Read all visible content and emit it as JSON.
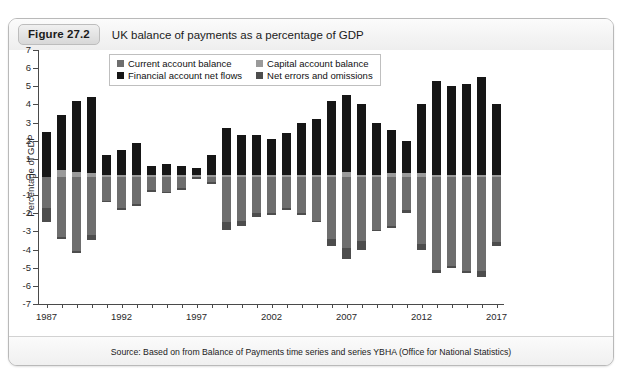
{
  "figure": {
    "badge": "Figure 27.2",
    "title": "UK balance of payments as a percentage of GDP",
    "source_prefix": "Source:",
    "source_text": "Source: Based on from Balance of Payments time series and series YBHA (Office for National Statistics)"
  },
  "colors": {
    "current_account": "#6e6e6e",
    "capital_account": "#9a9a9a",
    "financial_account": "#161616",
    "net_errors": "#4d4d4d",
    "axis": "#4a4a4a",
    "panel_border": "#b9b9b9",
    "header_bg": "#eeeeee"
  },
  "legend": {
    "position": "top-center-inside",
    "entries": [
      {
        "label": "Current account balance",
        "swatch": "#6e6e6e",
        "icon": "legend-swatch-icon"
      },
      {
        "label": "Capital account balance",
        "swatch": "#9a9a9a",
        "icon": "legend-swatch-icon"
      },
      {
        "label": "Financial account net flows",
        "swatch": "#161616",
        "icon": "legend-swatch-icon"
      },
      {
        "label": "Net errors and omissions",
        "swatch": "#4d4d4d",
        "icon": "legend-swatch-icon"
      }
    ]
  },
  "chart_data": {
    "type": "bar",
    "title": "UK balance of payments as a percentage of GDP",
    "subtitle": "",
    "xlabel": "",
    "ylabel": "Percentage of GDP",
    "stacked": true,
    "grid": false,
    "ylim": [
      -7,
      7
    ],
    "yticks": [
      7,
      6,
      5,
      4,
      3,
      2,
      1,
      0,
      -1,
      -2,
      -3,
      -4,
      -5,
      -6,
      -7
    ],
    "ytick_labels": [
      "7",
      "6",
      "5",
      "4",
      "3",
      "2",
      "1",
      "0",
      "-1",
      "-2",
      "-3",
      "-4",
      "-5",
      "-6",
      "-7"
    ],
    "xlim": [
      1986.5,
      2017.5
    ],
    "xticks": [
      1987,
      1992,
      1997,
      2002,
      2007,
      2012,
      2017
    ],
    "xtick_labels": [
      "1987",
      "1992",
      "1997",
      "2002",
      "2007",
      "2012",
      "2017"
    ],
    "x_all": [
      1987,
      1988,
      1989,
      1990,
      1991,
      1992,
      1993,
      1994,
      1995,
      1996,
      1997,
      1998,
      1999,
      2000,
      2001,
      2002,
      2003,
      2004,
      2005,
      2006,
      2007,
      2008,
      2009,
      2010,
      2011,
      2012,
      2013,
      2014,
      2015,
      2016,
      2017
    ],
    "categories": [
      "1987",
      "1988",
      "1989",
      "1990",
      "1991",
      "1992",
      "1993",
      "1994",
      "1995",
      "1996",
      "1997",
      "1998",
      "1999",
      "2000",
      "2001",
      "2002",
      "2003",
      "2004",
      "2005",
      "2006",
      "2007",
      "2008",
      "2009",
      "2010",
      "2011",
      "2012",
      "2013",
      "2014",
      "2015",
      "2016",
      "2017"
    ],
    "series": [
      {
        "name": "Current account balance",
        "color": "#6e6e6e",
        "values": [
          -1.7,
          -3.3,
          -4.1,
          -3.2,
          -1.3,
          -1.7,
          -1.5,
          -0.7,
          -0.8,
          -0.6,
          0.0,
          -0.3,
          -2.5,
          -2.4,
          -2.0,
          -2.0,
          -1.7,
          -2.0,
          -2.4,
          -3.4,
          -3.9,
          -3.5,
          -2.9,
          -2.7,
          -1.8,
          -3.7,
          -5.1,
          -4.9,
          -5.2,
          -5.2,
          -3.6
        ]
      },
      {
        "name": "Capital account balance",
        "color": "#9a9a9a",
        "values": [
          0.0,
          0.4,
          0.3,
          0.2,
          0.1,
          0.1,
          0.1,
          0.1,
          0.1,
          0.1,
          0.1,
          0.1,
          0.1,
          0.1,
          0.1,
          0.1,
          0.1,
          0.1,
          0.1,
          0.1,
          0.3,
          0.1,
          0.1,
          0.2,
          0.2,
          0.2,
          0.1,
          0.1,
          0.1,
          0.1,
          0.1
        ]
      },
      {
        "name": "Financial account net flows",
        "color": "#161616",
        "values": [
          2.5,
          3.0,
          3.9,
          4.2,
          1.1,
          1.4,
          1.8,
          0.5,
          0.6,
          0.5,
          0.4,
          1.1,
          2.6,
          2.2,
          2.2,
          2.0,
          2.3,
          2.9,
          3.1,
          4.1,
          4.2,
          3.9,
          2.9,
          2.4,
          1.8,
          3.8,
          5.2,
          4.9,
          5.0,
          5.4,
          3.9
        ]
      },
      {
        "name": "Net errors and omissions",
        "color": "#4d4d4d",
        "values": [
          -0.8,
          -0.1,
          -0.1,
          -0.3,
          -0.1,
          -0.1,
          -0.1,
          -0.1,
          -0.1,
          -0.1,
          -0.1,
          -0.1,
          -0.4,
          -0.3,
          -0.2,
          -0.1,
          -0.1,
          -0.1,
          -0.1,
          -0.4,
          -0.6,
          -0.5,
          -0.1,
          -0.1,
          -0.2,
          -0.3,
          -0.2,
          -0.1,
          -0.1,
          -0.3,
          -0.2
        ]
      }
    ]
  }
}
